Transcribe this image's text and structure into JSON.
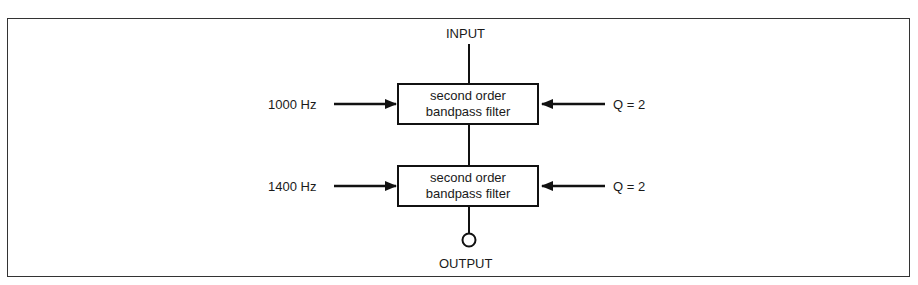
{
  "diagram": {
    "input_label": "INPUT",
    "output_label": "OUTPUT",
    "filters": [
      {
        "line1": "second order",
        "line2": "bandpass filter",
        "frequency_label": "1000 Hz",
        "q_label": "Q = 2"
      },
      {
        "line1": "second order",
        "line2": "bandpass filter",
        "frequency_label": "1400 Hz",
        "q_label": "Q = 2"
      }
    ]
  }
}
